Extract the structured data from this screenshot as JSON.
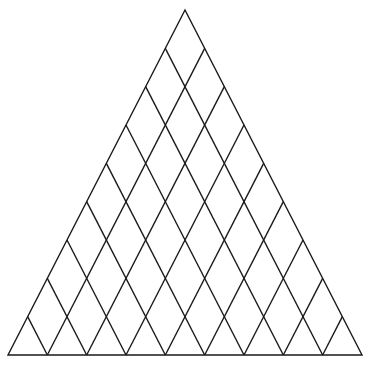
{
  "diagram": {
    "type": "triangular-diamond-lattice",
    "apex": [
      185,
      10
    ],
    "bottom_left": [
      8,
      355
    ],
    "bottom_right": [
      362,
      355
    ],
    "divisions": 9,
    "line_families": [
      "parallel-to-left-side",
      "parallel-to-right-side"
    ],
    "stroke_color": "#1a1a1a",
    "stroke_width": 1.4,
    "background": "#ffffff"
  }
}
